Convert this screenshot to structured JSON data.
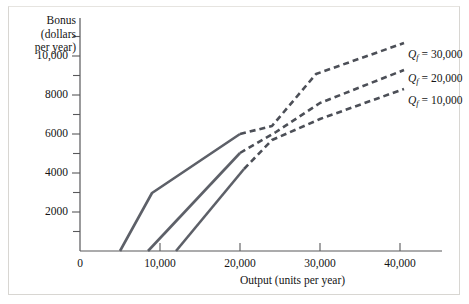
{
  "chart_data": {
    "type": "line",
    "title": "",
    "xlabel": "Output (units per year)",
    "ylabel": "Bonus (dollars per year)",
    "ylabel_lines": [
      "Bonus",
      "(dollars",
      "per year)"
    ],
    "xlim": [
      0,
      45000
    ],
    "ylim": [
      0,
      12000
    ],
    "grid": false,
    "legend_position": "right-inline",
    "xticks": [
      0,
      10000,
      20000,
      30000,
      40000
    ],
    "xtick_labels": [
      "0",
      "10,000",
      "20,000",
      "30,000",
      "40,000"
    ],
    "yticks": [
      0,
      2000,
      4000,
      6000,
      8000,
      10000
    ],
    "ytick_labels": [
      "",
      "2000",
      "4000",
      "6000",
      "8000",
      "10,000"
    ],
    "yticks_minor": [
      1000,
      3000,
      5000,
      7000,
      9000,
      11000
    ],
    "series": [
      {
        "name": "Qf = 10,000",
        "label_html": "Q<sub>f</sub> = 10,000",
        "label_text": "Qf = 10,000",
        "solid_points": [
          [
            12000,
            0
          ],
          [
            20500,
            4200
          ]
        ],
        "dashed_points": [
          [
            20500,
            4200
          ],
          [
            24000,
            5700
          ],
          [
            30000,
            6800
          ],
          [
            40500,
            8300
          ]
        ],
        "color": "#4c4f57"
      },
      {
        "name": "Qf = 20,000",
        "label_html": "Q<sub>f</sub> = 20,000",
        "label_text": "Qf = 20,000",
        "solid_points": [
          [
            8500,
            0
          ],
          [
            20000,
            5000
          ]
        ],
        "dashed_points": [
          [
            20000,
            5000
          ],
          [
            24500,
            6100
          ],
          [
            30000,
            7600
          ],
          [
            40500,
            9300
          ]
        ],
        "color": "#4c4f57"
      },
      {
        "name": "Qf = 30,000",
        "label_html": "Q<sub>f</sub> = 30,000",
        "label_text": "Qf = 30,000",
        "solid_points": [
          [
            5000,
            0
          ],
          [
            9000,
            3000
          ],
          [
            20000,
            6000
          ]
        ],
        "dashed_points": [
          [
            20000,
            6000
          ],
          [
            24000,
            6400
          ],
          [
            29500,
            9100
          ],
          [
            40500,
            10700
          ]
        ],
        "color": "#4c4f57"
      }
    ],
    "colors": {
      "solid_line": "#5d6068",
      "dashed_line": "#4c4f57",
      "axis": "#58585a",
      "text": "#141414",
      "background": "#ffffff",
      "frame_border": "#d8d6d2"
    }
  }
}
